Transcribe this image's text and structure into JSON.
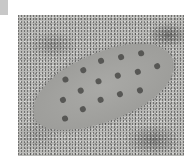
{
  "image": {
    "subject": "flatfish camouflaged on sandy seabed",
    "style": "grayscale photograph",
    "corner_marker_color": "#c8c8c8",
    "background_color": "#ffffff"
  },
  "spots": [
    [
      40,
      10
    ],
    [
      60,
      8
    ],
    [
      80,
      6
    ],
    [
      100,
      10
    ],
    [
      120,
      14
    ],
    [
      30,
      28
    ],
    [
      50,
      26
    ],
    [
      70,
      24
    ],
    [
      90,
      26
    ],
    [
      110,
      30
    ],
    [
      130,
      32
    ],
    [
      25,
      46
    ],
    [
      45,
      44
    ],
    [
      65,
      42
    ],
    [
      85,
      44
    ],
    [
      105,
      48
    ]
  ]
}
